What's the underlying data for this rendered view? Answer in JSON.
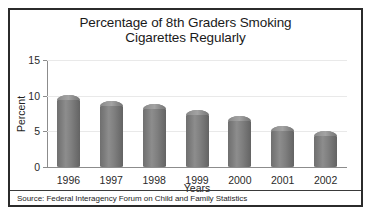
{
  "figure": {
    "source_note": "Source: Federal Interagency Forum on Child and Family Statistics",
    "border_color": "#2b2b2b",
    "background": "#ffffff"
  },
  "chart_data": {
    "type": "bar",
    "title": "Percentage of 8th Graders Smoking Cigarettes Regularly",
    "title_line1": "Percentage of 8th Graders Smoking",
    "title_line2": "Cigarettes Regularly",
    "xlabel": "Years",
    "ylabel": "Percent",
    "categories": [
      "1996",
      "1997",
      "1998",
      "1999",
      "2000",
      "2001",
      "2002"
    ],
    "values": [
      10.1,
      9.2,
      8.9,
      8.0,
      7.1,
      5.7,
      5.1
    ],
    "ylim": [
      0,
      15
    ],
    "yticks": [
      0,
      5,
      10,
      15
    ],
    "ytick_labels": [
      "0",
      "5",
      "10",
      "15"
    ],
    "grid": true,
    "grid_color": "#e9e9e9",
    "legend": null,
    "bar_color": "#7c7c7c",
    "axis_color": "#8c8c8c",
    "series": [
      {
        "name": "Percentage of 8th graders smoking cigarettes regularly",
        "values": [
          10.1,
          9.2,
          8.9,
          8.0,
          7.1,
          5.7,
          5.1
        ]
      }
    ]
  }
}
